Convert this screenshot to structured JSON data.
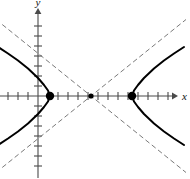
{
  "figure": {
    "kind": "hyperbola-graph",
    "background_color": "#ffffff",
    "curve_color": "#000000",
    "asymptote_color": "#7a7a7a",
    "axis_color": "#4a4a4a",
    "point_color": "#000000"
  },
  "axes": {
    "x_label": "x",
    "y_label": "y",
    "origin_px": {
      "x": 38,
      "y": 96
    },
    "tick_spacing_px": 10,
    "x_axis_y_px": 96,
    "y_axis_x_px": 38,
    "x_ticks_left_count": 3,
    "x_ticks_right_count": 13,
    "y_ticks_up_count": 8,
    "y_ticks_down_count": 7,
    "x_arrow_tip_px": 172,
    "y_arrow_tip_px": 14
  },
  "chart_data": {
    "type": "line",
    "title": "",
    "xlabel": "x",
    "ylabel": "y",
    "grid": false,
    "legend": "none",
    "axis_units_per_tick": 1,
    "xlim": [
      -4.0,
      14.0
    ],
    "ylim": [
      -8.0,
      8.5
    ],
    "hyperbola": {
      "orientation": "horizontal",
      "center": {
        "x": 5.3,
        "y": 0
      },
      "a": 4.1,
      "b": 3.3,
      "vertices": [
        {
          "x": 1.2,
          "y": 0,
          "label": ""
        },
        {
          "x": 9.4,
          "y": 0,
          "label": ""
        }
      ],
      "center_marker": {
        "x": 5.3,
        "y": 0
      },
      "asymptote_slopes": [
        0.805,
        -0.805
      ]
    },
    "series": [
      {
        "name": "left-branch",
        "style": "solid",
        "x": [
          -4.0,
          -3.0,
          -2.0,
          -1.0,
          0.0,
          0.6,
          1.0,
          1.2,
          1.0,
          0.6,
          0.0,
          -1.0,
          -2.0,
          -3.0,
          -4.0
        ],
        "y": [
          4.9,
          4.25,
          3.55,
          2.75,
          1.8,
          1.1,
          0.55,
          0.0,
          -0.55,
          -1.1,
          -1.8,
          -2.75,
          -3.55,
          -4.25,
          -4.9
        ]
      },
      {
        "name": "right-branch",
        "style": "solid",
        "x": [
          14.6,
          13.6,
          12.6,
          11.6,
          10.6,
          10.0,
          9.6,
          9.4,
          9.6,
          10.0,
          10.6,
          11.6,
          12.6,
          13.6,
          14.6
        ],
        "y": [
          4.9,
          4.25,
          3.55,
          2.75,
          1.8,
          1.1,
          0.55,
          0.0,
          -0.55,
          -1.1,
          -1.8,
          -2.75,
          -3.55,
          -4.25,
          -4.9
        ]
      },
      {
        "name": "asymptote-positive",
        "style": "dashed",
        "x": [
          -4.2,
          14.8
        ],
        "y": [
          -7.65,
          7.65
        ]
      },
      {
        "name": "asymptote-negative",
        "style": "dashed",
        "x": [
          -4.2,
          14.8
        ],
        "y": [
          7.65,
          -7.65
        ]
      }
    ],
    "markers": [
      {
        "name": "left-vertex",
        "x": 1.2,
        "y": 0
      },
      {
        "name": "center",
        "x": 5.3,
        "y": 0
      },
      {
        "name": "right-vertex",
        "x": 9.4,
        "y": 0
      }
    ]
  }
}
